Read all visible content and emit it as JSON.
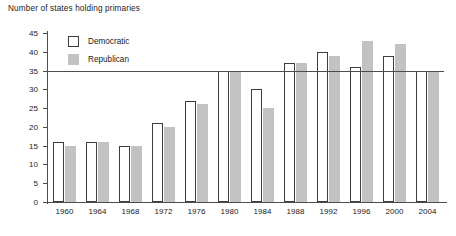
{
  "chart_data": {
    "type": "bar",
    "title": "Number of states holding primaries",
    "xlabel": "",
    "ylabel": "",
    "ylim": [
      0,
      45
    ],
    "ytick_step": 5,
    "yticks": [
      0,
      5,
      10,
      15,
      20,
      25,
      30,
      35,
      40,
      45
    ],
    "grid": false,
    "reference_line": 35,
    "legend_position": "top-left",
    "categories": [
      "1960",
      "1964",
      "1968",
      "1972",
      "1976",
      "1980",
      "1984",
      "1988",
      "1992",
      "1996",
      "2000",
      "2004"
    ],
    "series": [
      {
        "name": "Democratic",
        "color": "#ffffff",
        "edge_color": "#3d3d3d",
        "values": [
          16,
          16,
          15,
          21,
          27,
          35,
          30,
          37,
          40,
          36,
          39,
          35
        ]
      },
      {
        "name": "Republican",
        "color": "#c2c2c2",
        "edge_color": "#c2c2c2",
        "values": [
          15,
          16,
          15,
          20,
          26,
          35,
          25,
          37,
          39,
          43,
          42,
          35
        ]
      }
    ]
  }
}
